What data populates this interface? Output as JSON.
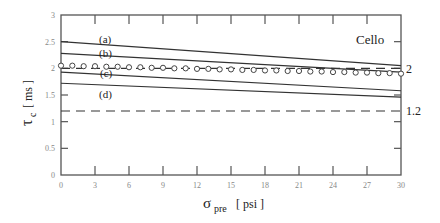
{
  "chart_data": {
    "type": "line",
    "title": "",
    "annotation": "Cello",
    "xlabel": "σ_pre [ psi ]",
    "xlabel_main": "σ",
    "xlabel_sub": "pre",
    "xlabel_unit": "[ psi ]",
    "ylabel": "τ_c [ ms ]",
    "ylabel_main": "τ",
    "ylabel_sub": "c",
    "ylabel_unit": "[ ms ]",
    "xlim": [
      0,
      30
    ],
    "ylim": [
      0,
      3
    ],
    "xticks": [
      "0",
      "3",
      "6",
      "9",
      "12",
      "15",
      "18",
      "21",
      "24",
      "27",
      "30"
    ],
    "yticks": [
      "0",
      "0.5",
      "1",
      "1.5",
      "2",
      "2.5",
      "3"
    ],
    "right_labels": [
      "2",
      "1.2"
    ],
    "grid": false,
    "series": [
      {
        "name": "(a)",
        "style": "solid",
        "x": [
          0,
          30
        ],
        "y": [
          2.5,
          2.05
        ]
      },
      {
        "name": "(b)",
        "style": "solid",
        "x": [
          0,
          30
        ],
        "y": [
          2.28,
          1.93
        ]
      },
      {
        "name": "(c)",
        "style": "solid",
        "x": [
          0,
          30
        ],
        "y": [
          1.93,
          1.58
        ]
      },
      {
        "name": "(d)",
        "style": "solid",
        "x": [
          0,
          30
        ],
        "y": [
          1.72,
          1.46
        ]
      },
      {
        "name": "reference 2",
        "style": "dashed",
        "x": [
          0,
          30
        ],
        "y": [
          2.0,
          2.0
        ]
      },
      {
        "name": "reference 1.2",
        "style": "dashed",
        "x": [
          0,
          30
        ],
        "y": [
          1.2,
          1.2
        ]
      },
      {
        "name": "measured",
        "style": "markers-circle",
        "x": [
          0,
          1,
          2,
          3,
          4,
          5,
          6,
          7,
          8,
          9,
          10,
          11,
          12,
          13,
          14,
          15,
          16,
          17,
          18,
          19,
          20,
          21,
          22,
          23,
          24,
          25,
          26,
          27,
          28,
          29,
          30
        ],
        "y": [
          2.05,
          2.05,
          2.04,
          2.04,
          2.03,
          2.03,
          2.02,
          2.02,
          2.01,
          2.01,
          2.0,
          2.0,
          1.99,
          1.99,
          1.98,
          1.98,
          1.97,
          1.97,
          1.96,
          1.96,
          1.95,
          1.95,
          1.94,
          1.94,
          1.93,
          1.93,
          1.92,
          1.92,
          1.91,
          1.91,
          1.9
        ]
      }
    ]
  }
}
